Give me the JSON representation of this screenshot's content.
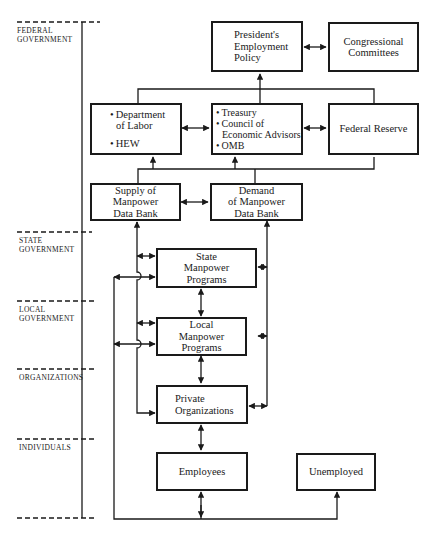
{
  "levels": [
    {
      "id": "federal",
      "lines": [
        "FEDERAL",
        "GOVERNMENT"
      ]
    },
    {
      "id": "state",
      "lines": [
        "STATE",
        "GOVERNMENT"
      ]
    },
    {
      "id": "local",
      "lines": [
        "LOCAL",
        "GOVERNMENT"
      ]
    },
    {
      "id": "organizations",
      "lines": [
        "ORGANIZATIONS"
      ]
    },
    {
      "id": "individuals",
      "lines": [
        "INDIVIDUALS"
      ]
    }
  ],
  "nodes": {
    "president": {
      "lines": [
        "President's",
        "Employment",
        "Policy"
      ]
    },
    "congress": {
      "lines": [
        "Congressional",
        "Committees"
      ]
    },
    "labor": {
      "items": [
        "Department",
        "of Labor",
        "HEW"
      ]
    },
    "treasury": {
      "items": [
        "Treasury",
        "Council of",
        "Economic Advisors",
        "OMB"
      ]
    },
    "fed": {
      "lines": [
        "Federal Reserve"
      ]
    },
    "supply": {
      "lines": [
        "Supply of",
        "Manpower",
        "Data Bank"
      ]
    },
    "demand": {
      "lines": [
        "Demand",
        "of Manpower",
        "Data Bank"
      ]
    },
    "state": {
      "lines": [
        "State",
        "Manpower",
        "Programs"
      ]
    },
    "local": {
      "lines": [
        "Local",
        "Manpower",
        "Programs"
      ]
    },
    "private": {
      "lines": [
        "Private",
        "Organizations"
      ]
    },
    "employees": {
      "lines": [
        "Employees"
      ]
    },
    "unemployed": {
      "lines": [
        "Unemployed"
      ]
    }
  },
  "colors": {
    "ink": "#1a1a1a",
    "background": "#ffffff"
  }
}
